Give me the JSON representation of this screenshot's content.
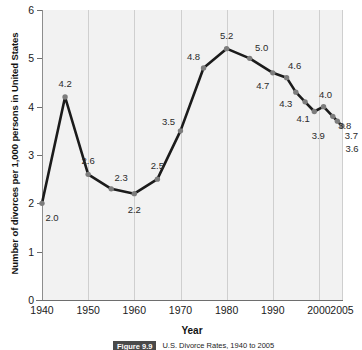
{
  "chart_data": {
    "type": "line",
    "title": "U.S. Divorce Rates, 1940 to 2005",
    "xlabel": "Year",
    "ylabel": "Number of divorces per 1,000 persons in United States",
    "xlim": [
      1940,
      2005
    ],
    "ylim": [
      0,
      6
    ],
    "ytick_labels": [
      "0",
      "1",
      "2",
      "3",
      "4",
      "5",
      "6"
    ],
    "ytick_values": [
      0,
      1,
      2,
      3,
      4,
      5,
      6
    ],
    "xtick_labels": [
      "1940",
      "1950",
      "1960",
      "1970",
      "1980",
      "1990",
      "2000",
      "2005"
    ],
    "xtick_values": [
      1940,
      1950,
      1960,
      1970,
      1980,
      1990,
      2000,
      2005
    ],
    "grid": "vertical",
    "legend": "none",
    "x": [
      1940,
      1945,
      1950,
      1955,
      1960,
      1965,
      1970,
      1975,
      1980,
      1985,
      1990,
      1993,
      1995,
      1997,
      1999,
      2001,
      2003,
      2004,
      2005
    ],
    "values": [
      2.0,
      4.2,
      2.6,
      2.3,
      2.2,
      2.5,
      3.5,
      4.8,
      5.2,
      5.0,
      4.7,
      4.6,
      4.3,
      4.1,
      3.9,
      4.0,
      3.8,
      3.7,
      3.6
    ],
    "point_labels": [
      "2.0",
      "4.2",
      "2.6",
      "2.3",
      "2.2",
      "2.5",
      "3.5",
      "4.8",
      "5.2",
      "5.0",
      "4.7",
      "4.6",
      "4.3",
      "4.1",
      "3.9",
      "4.0",
      "3.8",
      "3.7",
      "3.6"
    ],
    "label_offsets": [
      [
        10,
        14
      ],
      [
        0,
        -14
      ],
      [
        0,
        -14
      ],
      [
        10,
        -12
      ],
      [
        0,
        15
      ],
      [
        0,
        -14
      ],
      [
        -12,
        -10
      ],
      [
        -10,
        -12
      ],
      [
        0,
        -14
      ],
      [
        12,
        -11
      ],
      [
        -10,
        12
      ],
      [
        8,
        -13
      ],
      [
        -10,
        11
      ],
      [
        -2,
        16
      ],
      [
        4,
        23
      ],
      [
        2,
        -13
      ],
      [
        12,
        9
      ],
      [
        14,
        14
      ],
      [
        10,
        22
      ]
    ],
    "line_color": "#1b1b1b",
    "marker_color": "#7d7d7d",
    "plot_background": "#f2f2f2",
    "gridline_color": "#cfcfcf"
  },
  "caption": {
    "badge": "Figure 9.9",
    "text": "U.S. Divorce Rates, 1940 to 2005"
  }
}
